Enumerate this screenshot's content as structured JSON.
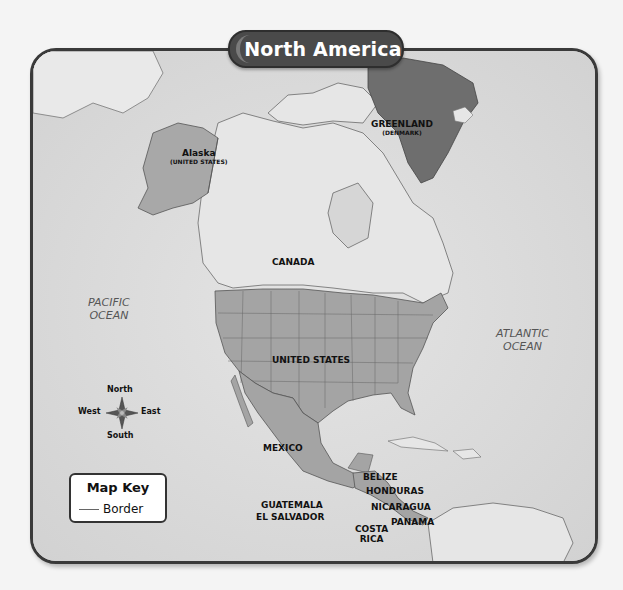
{
  "title": "North America",
  "labels": {
    "alaska": "Alaska",
    "alaska_sub": "(UNITED STATES)",
    "greenland": "GREENLAND",
    "greenland_sub": "(DENMARK)",
    "canada": "CANADA",
    "united_states": "UNITED STATES",
    "mexico": "MEXICO",
    "belize": "BELIZE",
    "honduras": "HONDURAS",
    "guatemala": "GUATEMALA",
    "el_salvador": "EL SALVADOR",
    "nicaragua": "NICARAGUA",
    "costa_rica_1": "COSTA",
    "costa_rica_2": "RICA",
    "panama": "PANAMA"
  },
  "oceans": {
    "pacific_1": "PACIFIC",
    "pacific_2": "OCEAN",
    "atlantic_1": "ATLANTIC",
    "atlantic_2": "OCEAN"
  },
  "compass": {
    "north": "North",
    "south": "South",
    "east": "East",
    "west": "West",
    "icon": "compass-rose-icon"
  },
  "map_key": {
    "title": "Map Key",
    "items": [
      {
        "symbol": "line",
        "label": "Border"
      }
    ]
  },
  "colors": {
    "frame": "#3a3a3a",
    "title_bg": "#4a4a4a",
    "ocean": "#dcdcdc",
    "land": "#e6e6e6",
    "us_highlight": "#9e9e9e",
    "greenland": "#6e6e6e"
  }
}
